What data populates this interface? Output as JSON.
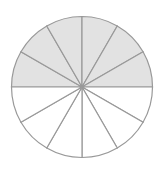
{
  "figure": {
    "name": "fraction-circle",
    "kind": "pie",
    "background_color": "#ffffff",
    "width": 165,
    "height": 171
  },
  "chart_data": {
    "type": "pie",
    "title": "",
    "subtitle": "",
    "xlabel": "",
    "ylabel": "",
    "legend": [],
    "legend_position": "none",
    "grid": false,
    "total_slices": 12,
    "slice_angle_degrees": 30,
    "shaded_count": 6,
    "unshaded_count": 6,
    "fraction_shaded": "6/12",
    "categories": [
      "slice-1",
      "slice-2",
      "slice-3",
      "slice-4",
      "slice-5",
      "slice-6",
      "slice-7",
      "slice-8",
      "slice-9",
      "slice-10",
      "slice-11",
      "slice-12"
    ],
    "values": [
      30,
      30,
      30,
      30,
      30,
      30,
      30,
      30,
      30,
      30,
      30,
      30
    ],
    "series": [
      {
        "name": "shaded",
        "values": [
          1,
          1,
          1,
          1,
          1,
          1,
          0,
          0,
          0,
          0,
          0,
          0
        ]
      }
    ],
    "slices": [
      {
        "index": 1,
        "start_deg": 180,
        "end_deg": 210,
        "shaded": true
      },
      {
        "index": 2,
        "start_deg": 210,
        "end_deg": 240,
        "shaded": true
      },
      {
        "index": 3,
        "start_deg": 240,
        "end_deg": 270,
        "shaded": true
      },
      {
        "index": 4,
        "start_deg": 270,
        "end_deg": 300,
        "shaded": true
      },
      {
        "index": 5,
        "start_deg": 300,
        "end_deg": 330,
        "shaded": true
      },
      {
        "index": 6,
        "start_deg": 330,
        "end_deg": 360,
        "shaded": true
      },
      {
        "index": 7,
        "start_deg": 0,
        "end_deg": 30,
        "shaded": false
      },
      {
        "index": 8,
        "start_deg": 30,
        "end_deg": 60,
        "shaded": false
      },
      {
        "index": 9,
        "start_deg": 60,
        "end_deg": 90,
        "shaded": false
      },
      {
        "index": 10,
        "start_deg": 90,
        "end_deg": 120,
        "shaded": false
      },
      {
        "index": 11,
        "start_deg": 120,
        "end_deg": 150,
        "shaded": false
      },
      {
        "index": 12,
        "start_deg": 150,
        "end_deg": 180,
        "shaded": false
      }
    ],
    "geometry": {
      "center_x": 82,
      "center_y": 87,
      "radius": 70.5
    },
    "style": {
      "shaded_fill": "#e2e2e2",
      "unshaded_fill": "#ffffff",
      "stroke_color": "#999999",
      "stroke_width": 1.2
    }
  }
}
